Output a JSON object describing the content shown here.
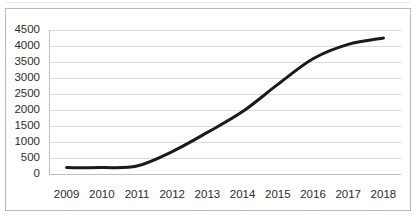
{
  "chart_data": {
    "type": "line",
    "title": "",
    "subtitle": "",
    "xlabel": "",
    "ylabel": "",
    "categories": [
      "2009",
      "2010",
      "2011",
      "2012",
      "2013",
      "2014",
      "2015",
      "2016",
      "2017",
      "2018"
    ],
    "x": [
      2009,
      2010,
      2011,
      2012,
      2013,
      2014,
      2015,
      2016,
      2017,
      2018
    ],
    "values": [
      200,
      200,
      250,
      700,
      1300,
      1950,
      2800,
      3600,
      4050,
      4250
    ],
    "series": [
      {
        "name": "",
        "values": [
          200,
          200,
          250,
          700,
          1300,
          1950,
          2800,
          3600,
          4050,
          4250
        ]
      }
    ],
    "ylim": [
      0,
      4500
    ],
    "yticks": [
      0,
      500,
      1000,
      1500,
      2000,
      2500,
      3000,
      3500,
      4000,
      4500
    ],
    "ytick_labels": [
      "0",
      "500",
      "1000",
      "1500",
      "2000",
      "2500",
      "3000",
      "3500",
      "4000",
      "4500"
    ],
    "xtick_labels": [
      "2009",
      "2010",
      "2011",
      "2012",
      "2013",
      "2014",
      "2015",
      "2016",
      "2017",
      "2018"
    ],
    "grid": "horizontal",
    "legend": "none",
    "line_color": "#1a1a1a",
    "line_width": 3,
    "gridline_color": "#d9d9d9",
    "axis_color": "#bfbfbf",
    "background_color": "#ffffff",
    "border_color": "#b9b9b9",
    "tick_label_color": "#2b2b2b",
    "smoothed": true
  }
}
